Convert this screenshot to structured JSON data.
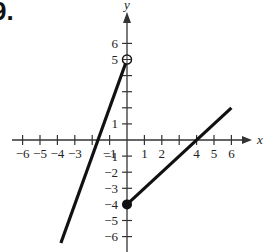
{
  "problem_number": "9.",
  "chart_data": {
    "type": "line",
    "title": "",
    "xlabel": "x",
    "ylabel": "y",
    "xlim": [
      -6,
      6
    ],
    "ylim": [
      -6,
      6
    ],
    "x_ticks": [
      -6,
      -5,
      -4,
      -3,
      -2,
      -1,
      1,
      2,
      3,
      4,
      5,
      6
    ],
    "x_tick_labels": [
      "-6",
      "-5",
      "-4",
      "-3",
      "",
      "-1",
      "1",
      "2",
      "",
      "4",
      "5",
      "6"
    ],
    "y_ticks": [
      -6,
      -5,
      -4,
      -3,
      -2,
      -1,
      1,
      2,
      3,
      4,
      5,
      6
    ],
    "y_tick_labels": [
      "-6",
      "-5",
      "-4",
      "-3",
      "-2",
      "-1",
      "1",
      "",
      "",
      "",
      "5",
      "6"
    ],
    "grid": false,
    "series": [
      {
        "name": "left piece",
        "description": "y = 3x + 5 for x < 0",
        "points": [
          [
            -3.8,
            -6.4
          ],
          [
            0,
            5
          ]
        ],
        "endpoint": {
          "x": 0,
          "y": 5,
          "style": "open"
        }
      },
      {
        "name": "right piece",
        "description": "y = x - 4 for x >= 0",
        "points": [
          [
            0,
            -4
          ],
          [
            6,
            2
          ]
        ],
        "endpoint": {
          "x": 0,
          "y": -4,
          "style": "closed"
        }
      }
    ],
    "colors": {
      "line": "#111111",
      "axis": "#333333"
    }
  }
}
